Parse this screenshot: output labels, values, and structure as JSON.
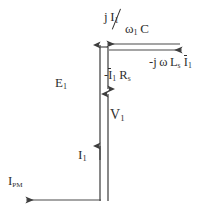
{
  "diagram": {
    "type": "phasor-diagram",
    "title": "",
    "stroke_color": "#4a4a4a",
    "text_color": "#2f2f2f",
    "background": "#ffffff",
    "labels": {
      "capacitive_drop": {
        "name": "j-I1-over-omega1-C",
        "numerator_j": "j",
        "numerator_I": "I",
        "numerator_I_sub": "1",
        "denominator_omega": "ω",
        "denominator_omega_sub": "1",
        "denominator_C": "C"
      },
      "inductive_drop": {
        "name": "minus-j-omega-Ls-I1",
        "prefix": "-j",
        "omega": "ω",
        "L": "L",
        "L_sub": "s",
        "I": "I",
        "I_sub": "1"
      },
      "resistive_drop": {
        "name": "minus-I1-Rs",
        "prefix": "-",
        "I": "I",
        "I_sub": "1",
        "R": "R",
        "R_sub": "s"
      },
      "emf": {
        "name": "E1",
        "symbol": "E",
        "sub": "1"
      },
      "terminal_voltage": {
        "name": "V1",
        "symbol": "V",
        "sub": "1"
      },
      "current": {
        "name": "I1",
        "symbol": "I",
        "sub": "1"
      },
      "pm_current": {
        "name": "IPM",
        "symbol": "I",
        "sub": "PM"
      }
    },
    "vectors": [
      {
        "name": "emf-vector-E1",
        "direction": "up",
        "x": 100,
        "from_y": 200,
        "to_y": 44
      },
      {
        "name": "resistive-drop-vector",
        "direction": "down",
        "x": 108,
        "from_y": 47,
        "to_y": 90
      },
      {
        "name": "terminal-voltage-vector-V1",
        "direction": "up",
        "x": 108,
        "from_y": 200,
        "to_y": 93
      },
      {
        "name": "capacitive-vector",
        "direction": "left",
        "y": 47,
        "from_x": 180,
        "to_x": 106
      },
      {
        "name": "inductive-vector",
        "direction": "right",
        "y": 47,
        "from_x": 108,
        "to_x": 182
      },
      {
        "name": "pm-current-vector-IPM",
        "direction": "left",
        "y": 200,
        "from_x": 100,
        "to_x": 25
      }
    ]
  }
}
